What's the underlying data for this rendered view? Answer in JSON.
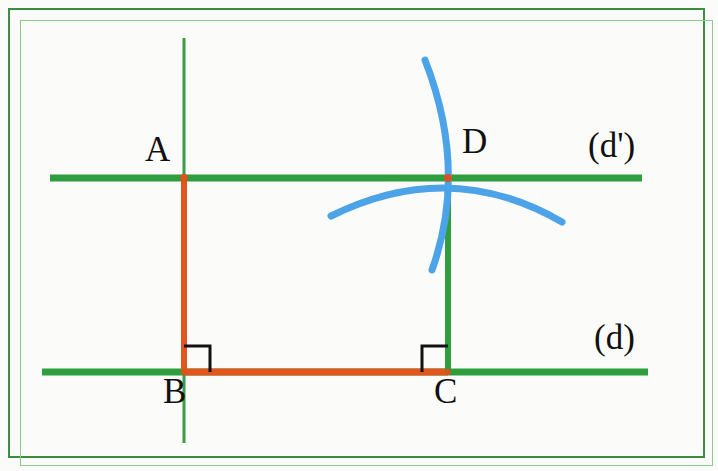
{
  "figure": {
    "width": 718,
    "height": 471,
    "background_color": "#fbfcfa",
    "frame": {
      "color": "#3b8f3f",
      "inner_color": "#8fc890",
      "x": 8,
      "y": 8,
      "width": 697,
      "height": 450
    }
  },
  "colors": {
    "green_line": "#2f9e3f",
    "green_thin": "#3c9c46",
    "orange_segment": "#e2551d",
    "blue_arc": "#4da3e8",
    "point_dot": "#d9531e",
    "right_angle": "#111111",
    "label_text": "#111111"
  },
  "labels": {
    "point_a": "A",
    "point_b": "B",
    "point_c": "C",
    "point_d": "D",
    "line_d": "(d)",
    "line_d_prime": "(d')"
  },
  "points": {
    "A": {
      "x": 184,
      "y": 178
    },
    "B": {
      "x": 184,
      "y": 372
    },
    "C": {
      "x": 448,
      "y": 372
    },
    "D": {
      "x": 448,
      "y": 178
    }
  },
  "lines": {
    "d_prime": {
      "x1": 50,
      "y1": 178,
      "x2": 642,
      "y2": 178,
      "thickness": 7,
      "color": "#2f9e3f"
    },
    "d": {
      "x1": 42,
      "y1": 372,
      "x2": 648,
      "y2": 372,
      "thickness": 7,
      "color": "#2f9e3f"
    },
    "vertical_through_a": {
      "x1": 184,
      "y1": 38,
      "x2": 184,
      "y2": 443,
      "thickness": 3,
      "color": "#3c9c46"
    },
    "segment_cd": {
      "x1": 448,
      "y1": 178,
      "x2": 448,
      "y2": 372,
      "thickness": 6,
      "color": "#2f9e3f"
    },
    "segment_ab": {
      "x1": 184,
      "y1": 178,
      "x2": 184,
      "y2": 372,
      "thickness": 6,
      "color": "#e2551d"
    },
    "segment_bc": {
      "x1": 184,
      "y1": 372,
      "x2": 448,
      "y2": 372,
      "thickness": 7,
      "color": "#e2551d"
    }
  },
  "arcs": [
    {
      "name": "vertical-compass-arc",
      "start": {
        "x": 425,
        "y": 60
      },
      "control": {
        "x": 468,
        "y": 170
      },
      "end": {
        "x": 432,
        "y": 270
      },
      "color": "#4da3e8",
      "thickness": 7
    },
    {
      "name": "horizontal-compass-arc",
      "start": {
        "x": 331,
        "y": 216
      },
      "control": {
        "x": 450,
        "y": 157
      },
      "end": {
        "x": 562,
        "y": 222
      },
      "color": "#4da3e8",
      "thickness": 7
    }
  ],
  "right_angles": [
    {
      "name": "right-angle-b",
      "vertex": {
        "x": 184,
        "y": 372
      },
      "size": 26,
      "open": "right",
      "color": "#111111"
    },
    {
      "name": "right-angle-c",
      "vertex": {
        "x": 448,
        "y": 372
      },
      "size": 26,
      "open": "left",
      "color": "#111111"
    }
  ],
  "label_positions": {
    "A": {
      "x": 145,
      "y": 132
    },
    "B": {
      "x": 163,
      "y": 374
    },
    "C": {
      "x": 434,
      "y": 374
    },
    "D": {
      "x": 462,
      "y": 124
    },
    "line_d_prime": {
      "x": 588,
      "y": 128
    },
    "line_d": {
      "x": 594,
      "y": 320
    }
  }
}
